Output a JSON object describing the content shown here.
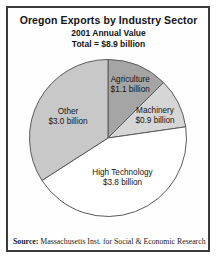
{
  "chart_data": {
    "type": "pie",
    "title": "Oregon Exports by Industry Sector",
    "subtitle": "2001 Annual Value",
    "total_label": "Total = $8.9 billion",
    "total_value_billion": 8.9,
    "start_angle_deg": 0,
    "direction": "clockwise",
    "outline_color": "#5a5a5a",
    "slices": [
      {
        "label": "Agriculture",
        "value": 1.1,
        "value_text": "$1.1 billion",
        "color": "#a5a5a5"
      },
      {
        "label": "Machinery",
        "value": 0.9,
        "value_text": "$0.9 billion",
        "color": "#d6d6d6"
      },
      {
        "label": "High Technology",
        "value": 3.8,
        "value_text": "$3.8 billion",
        "color": "#ffffff"
      },
      {
        "label": "Other",
        "value": 3.0,
        "value_text": "$3.0 billion",
        "color": "#c8c8c8"
      }
    ]
  },
  "footer": {
    "source_label": "Source:",
    "source_text": " Massachusetts Inst. for Social & Economic Research"
  }
}
